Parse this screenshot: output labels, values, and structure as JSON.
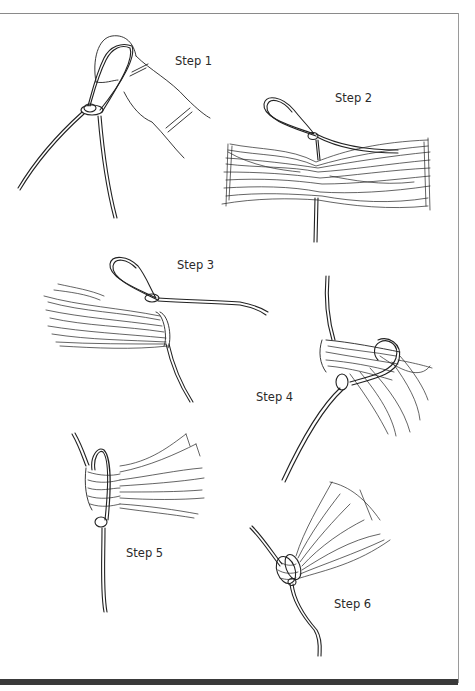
{
  "page": {
    "type": "instruction-illustration",
    "background": "#ffffff",
    "ink_color": "#222222",
    "bottom_bar_color": "#3a3a3a"
  },
  "steps": [
    {
      "number": 1,
      "label": "Step 1",
      "depicts": "cord looped over fingertip with slip knot"
    },
    {
      "number": 2,
      "label": "Step 2",
      "depicts": "loop with knot tied around middle of fiber bundle"
    },
    {
      "number": 3,
      "label": "Step 3",
      "depicts": "fiber bundle folded with loop above and cord wrapped"
    },
    {
      "number": 4,
      "label": "Step 4",
      "depicts": "cord wrapped around top of tassel with loop"
    },
    {
      "number": 5,
      "label": "Step 5",
      "depicts": "wrapped tassel head with loop pulled down"
    },
    {
      "number": 6,
      "label": "Step 6",
      "depicts": "finished tassel on cord"
    }
  ]
}
